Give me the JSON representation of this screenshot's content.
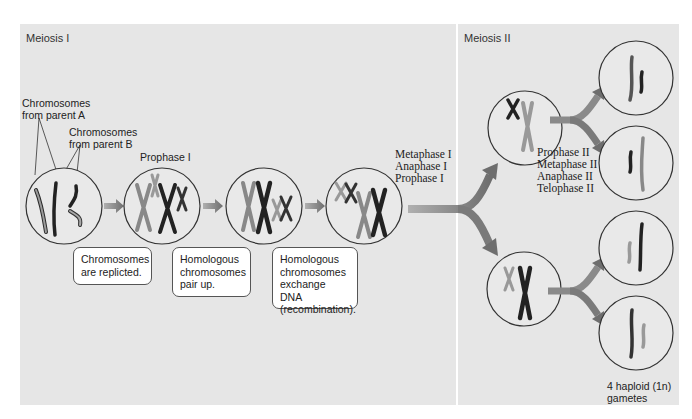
{
  "panels": {
    "meiosis_1": {
      "title": "Meiosis I"
    },
    "meiosis_2": {
      "title": "Meiosis II"
    }
  },
  "labels": {
    "parent_a": [
      "Chromosomes",
      "from parent A"
    ],
    "parent_b": [
      "Chromosomes",
      "from parent B"
    ],
    "prophase_1": "Prophase I",
    "meiosis_1_phases": [
      "Metaphase I",
      "Anaphase I",
      "Prophase I"
    ],
    "meiosis_2_phases": [
      "Prophase II",
      "Metaphase II",
      "Anaphase II",
      "Telophase II"
    ],
    "gametes": [
      "4 haploid (1n)",
      "gametes"
    ]
  },
  "callouts": [
    {
      "lines": [
        "Chromosomes",
        "are replicted."
      ]
    },
    {
      "lines": [
        "Homologous",
        "chromosomes",
        "pair up."
      ]
    },
    {
      "lines": [
        "Homologous",
        "chromosomes",
        "exchange DNA",
        "(recombination)."
      ]
    }
  ],
  "colors": {
    "panel_bg": "#e6e6e6",
    "cell_fill": "#e9e9e9",
    "cell_stroke": "#333333",
    "arrow": "#7a7a7a",
    "chrom_dark": "#2a2a2a",
    "chrom_light": "#a8a8a8"
  }
}
